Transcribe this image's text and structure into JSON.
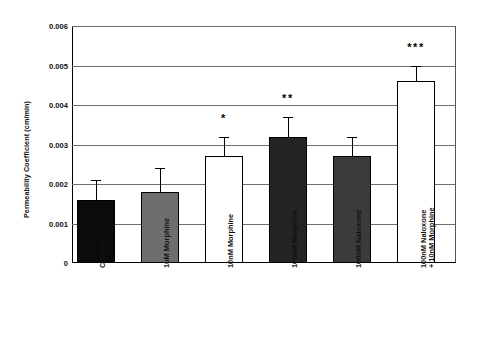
{
  "chart_data": {
    "type": "bar",
    "title": "",
    "xlabel": "",
    "ylabel": "Permeability Coefficient (cm/min)",
    "ylim": [
      0,
      0.006
    ],
    "ytick_labels": [
      "0.006",
      "0.005",
      "0.004",
      "0.003",
      "0.002",
      "0.001",
      "0"
    ],
    "ytick_values": [
      0.006,
      0.005,
      0.004,
      0.003,
      0.002,
      0.001,
      0
    ],
    "grid": true,
    "legend": "none",
    "categories": [
      "CONTROL",
      "1uM Morphine",
      "10nM Morphine",
      "100nM Morphine",
      "100nM Naloxone",
      "100nM Naloxone\n+ 10nM Morphine"
    ],
    "values": [
      0.0016,
      0.0018,
      0.0027,
      0.0032,
      0.0027,
      0.0046
    ],
    "errors": [
      0.0005,
      0.0006,
      0.0005,
      0.0005,
      0.0005,
      0.0004
    ],
    "fills": [
      "#0b0b0b",
      "#6e6e6e",
      "#ffffff",
      "#242424",
      "#3b3b3b",
      "#ffffff"
    ],
    "significance": [
      "",
      "",
      "*",
      "**",
      "",
      "***"
    ],
    "bars": [
      {
        "category": "CONTROL",
        "value": 0.0016,
        "error": 0.0005,
        "fill": "#0b0b0b",
        "significance": ""
      },
      {
        "category": "1uM Morphine",
        "value": 0.0018,
        "error": 0.0006,
        "fill": "#6e6e6e",
        "significance": ""
      },
      {
        "category": "10nM Morphine",
        "value": 0.0027,
        "error": 0.0005,
        "fill": "#ffffff",
        "significance": "*"
      },
      {
        "category": "100nM Morphine",
        "value": 0.0032,
        "error": 0.0005,
        "fill": "#242424",
        "significance": "**"
      },
      {
        "category": "100nM Naloxone",
        "value": 0.0027,
        "error": 0.0005,
        "fill": "#3b3b3b",
        "significance": ""
      },
      {
        "category": "100nM Naloxone + 10nM Morphine",
        "value": 0.0046,
        "error": 0.0004,
        "fill": "#ffffff",
        "significance": "***"
      }
    ],
    "axis_color": "#000000",
    "grid_color": "#6d6d6d",
    "background": "#ffffff"
  }
}
